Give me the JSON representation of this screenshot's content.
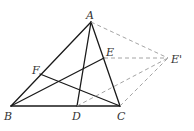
{
  "diagram": {
    "type": "geometry-figure",
    "points": {
      "A": {
        "label": "A",
        "x": 91,
        "y": 22
      },
      "B": {
        "label": "B",
        "x": 11,
        "y": 106
      },
      "C": {
        "label": "C",
        "x": 120,
        "y": 106
      },
      "D": {
        "label": "D",
        "x": 77,
        "y": 106
      },
      "E": {
        "label": "E",
        "x": 104,
        "y": 58
      },
      "E_prime": {
        "label": "E'",
        "x": 168,
        "y": 58
      },
      "F": {
        "label": "F",
        "x": 40,
        "y": 74
      }
    },
    "solid_segments": [
      [
        "A",
        "B"
      ],
      [
        "A",
        "C"
      ],
      [
        "B",
        "C"
      ],
      [
        "A",
        "D"
      ],
      [
        "B",
        "E"
      ],
      [
        "C",
        "F"
      ]
    ],
    "dashed_segments": [
      [
        "A",
        "E'"
      ],
      [
        "E",
        "E'"
      ],
      [
        "D",
        "E'"
      ],
      [
        "C",
        "E'"
      ]
    ],
    "colors": {
      "solid": "#1a1a1a",
      "dashed": "#9a9a9a",
      "background": "#ffffff"
    }
  }
}
